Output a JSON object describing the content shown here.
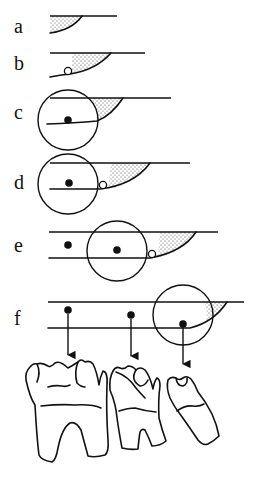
{
  "figure": {
    "panels": [
      {
        "label": "a",
        "elements": [
          "jaw-line",
          "shaded-region"
        ]
      },
      {
        "label": "b",
        "elements": [
          "jaw-lines",
          "shaded-region",
          "open-circle"
        ]
      },
      {
        "label": "c",
        "elements": [
          "jaw-lines",
          "shaded-region",
          "large-circle",
          "filled-dot"
        ]
      },
      {
        "label": "d",
        "elements": [
          "jaw-lines",
          "shaded-region",
          "large-circle",
          "filled-dot",
          "open-circle"
        ]
      },
      {
        "label": "e",
        "elements": [
          "jaw-lines",
          "shaded-region",
          "large-circle",
          "filled-dots",
          "open-circle"
        ]
      },
      {
        "label": "f",
        "elements": [
          "jaw-lines",
          "shaded-region",
          "large-circle",
          "filled-dots",
          "arrows"
        ]
      }
    ],
    "teeth": [
      "first-molar",
      "second-molar",
      "third-molar"
    ],
    "colors": {
      "ink": "#111111",
      "background": "#ffffff"
    }
  }
}
